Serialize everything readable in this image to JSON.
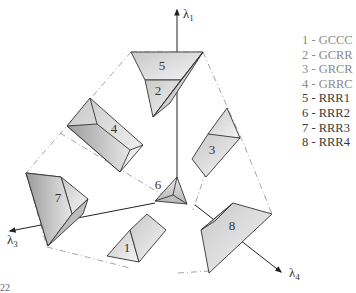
{
  "diagram": {
    "axes": [
      {
        "id": "lambda1",
        "label": "λ",
        "subscript": "1"
      },
      {
        "id": "lambda3",
        "label": "λ",
        "subscript": "3"
      },
      {
        "id": "lambda4",
        "label": "λ",
        "subscript": "4"
      }
    ],
    "regions": [
      {
        "number": "1"
      },
      {
        "number": "2"
      },
      {
        "number": "3"
      },
      {
        "number": "4"
      },
      {
        "number": "5"
      },
      {
        "number": "6"
      },
      {
        "number": "7"
      },
      {
        "number": "8"
      }
    ],
    "legend": [
      {
        "text": "1 - GCCC",
        "group": "g"
      },
      {
        "text": "2 - GCRR",
        "group": "g"
      },
      {
        "text": "3 - GRCR",
        "group": "g"
      },
      {
        "text": "4 - GRRC",
        "group": "g"
      },
      {
        "text": "5 - RRR1",
        "group": "r"
      },
      {
        "text": "6 - RRR2",
        "group": "r"
      },
      {
        "text": "7 - RRR3",
        "group": "r"
      },
      {
        "text": "8 - RRR4",
        "group": "r"
      }
    ],
    "footer_fragment": "22"
  },
  "colors": {
    "stroke": "#333333",
    "dash": "#9a9a9a",
    "legend_gray": "#8a8a8a",
    "legend_dark": "#3a3a3a"
  }
}
